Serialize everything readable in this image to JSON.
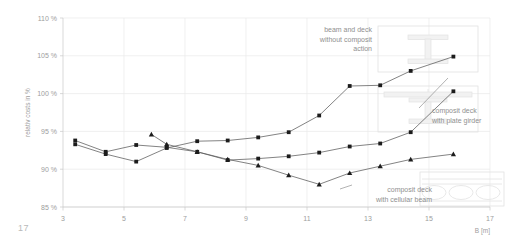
{
  "page": {
    "number": "17"
  },
  "chart_data": {
    "type": "line",
    "title": "",
    "xlabel": "B [m]",
    "ylabel": "relativ costs in %",
    "xlim": [
      3,
      17
    ],
    "ylim": [
      85,
      110
    ],
    "xticks": [
      3,
      5,
      7,
      9,
      11,
      13,
      15,
      17
    ],
    "xticklabels": [
      "3",
      "5",
      "7",
      "9",
      "11",
      "13",
      "15",
      "17"
    ],
    "yticks": [
      85,
      90,
      95,
      100,
      105,
      110
    ],
    "yticklabels": [
      "85 %",
      "90 %",
      "95 %",
      "100 %",
      "105 %",
      "110 %"
    ],
    "grid": true,
    "legend_position": "annotations-inline",
    "series": [
      {
        "name": "beam and deck without composit action",
        "marker": "square",
        "x": [
          3.4,
          4.4,
          5.4,
          6.4,
          7.4,
          8.4,
          9.4,
          10.4,
          11.4,
          12.4,
          13.4,
          14.4,
          15.8
        ],
        "values": [
          93.3,
          92.0,
          91.0,
          92.8,
          93.7,
          93.8,
          94.2,
          94.9,
          97.1,
          101.0,
          101.1,
          103.0,
          104.9
        ]
      },
      {
        "name": "composit deck with plate girder",
        "marker": "square",
        "x": [
          3.4,
          4.4,
          5.4,
          6.4,
          7.4,
          8.4,
          9.4,
          10.4,
          11.4,
          12.4,
          13.4,
          14.4,
          15.8
        ],
        "values": [
          93.8,
          92.3,
          93.2,
          92.9,
          92.3,
          91.2,
          91.4,
          91.7,
          92.2,
          93.0,
          93.4,
          94.9,
          100.3
        ]
      },
      {
        "name": "composit deck with cellular beam",
        "marker": "triangle",
        "x": [
          5.9,
          6.4,
          7.4,
          8.4,
          9.4,
          10.4,
          11.4,
          12.4,
          13.4,
          14.4,
          15.8
        ],
        "values": [
          94.6,
          93.3,
          92.3,
          91.3,
          90.5,
          89.2,
          88.0,
          89.5,
          90.4,
          91.3,
          92.0
        ]
      }
    ],
    "annotations": [
      {
        "name": "beam-and-deck-without-composit-action",
        "lines": [
          "beam and deck",
          "without composit",
          "action"
        ]
      },
      {
        "name": "composit-deck-with-plate-girder",
        "lines": [
          "composit deck",
          "with plate girder"
        ]
      },
      {
        "name": "composit-deck-with-cellular-beam",
        "lines": [
          "composit deck",
          "with cellular beam"
        ]
      }
    ],
    "icons": [
      {
        "name": "i-beam-section-icon"
      },
      {
        "name": "composite-plate-girder-section-icon"
      },
      {
        "name": "cellular-beam-elevation-icon"
      }
    ],
    "colors": {
      "grid": "#e9e9e9",
      "axis": "#c9c9c9",
      "line": "#5a5a5a",
      "marker": "#1c1c1c",
      "text": "#9d9d9d",
      "annotation": "#8f8f8f",
      "icon": "#e2e2e2"
    }
  }
}
